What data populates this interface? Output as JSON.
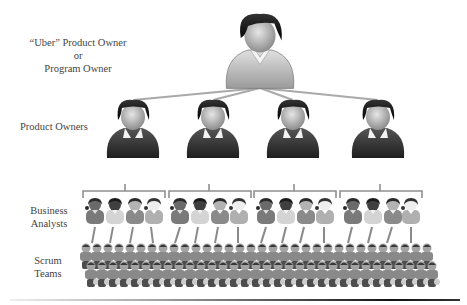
{
  "tiers": {
    "uber": {
      "label_line1": "“Uber” Product Owner",
      "label_line2": "or",
      "label_line3": "Program Owner"
    },
    "product_owners": {
      "label": "Product Owners",
      "count": 4
    },
    "business_analysts": {
      "label_line1": "Business",
      "label_line2": "Analysts",
      "groups": 4,
      "per_group": 4
    },
    "scrum_teams": {
      "label_line1": "Scrum",
      "label_line2": "Teams"
    }
  },
  "colors": {
    "connector": "#a8a8a8",
    "hair": "#1a1a1a",
    "face": "#bdbdbd",
    "body_dark": "#3a3a3a",
    "body_light": "#cfcfcf",
    "text": "#444444"
  }
}
